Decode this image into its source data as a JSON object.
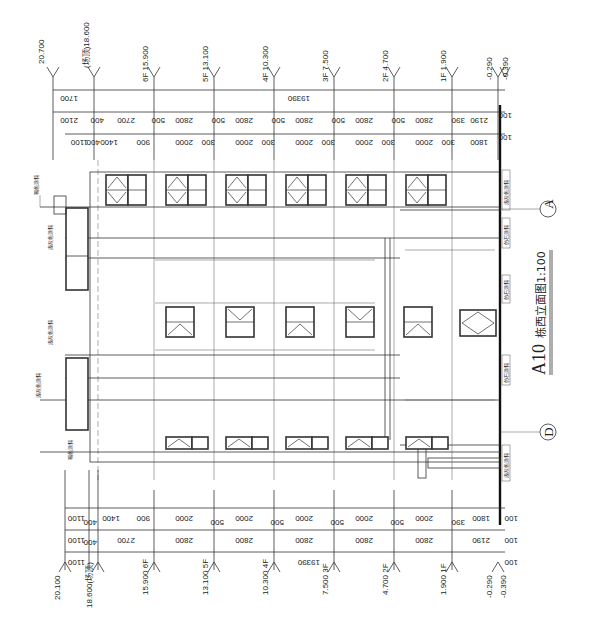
{
  "drawing": {
    "title": "A10栋西立面图1:100",
    "title_prefix": "A10",
    "title_suffix": "栋西立面图1:100",
    "orientation": "rotated 90° clockwise"
  },
  "axes": {
    "A": "A",
    "D": "D"
  },
  "levels_top": [
    {
      "label": "20.700"
    },
    {
      "label": "(场顶)18.600"
    },
    {
      "label": "6F 15.900"
    },
    {
      "label": "5F 13.100"
    },
    {
      "label": "4F 10.300"
    },
    {
      "label": "3F 7.500"
    },
    {
      "label": "2F 4.700"
    },
    {
      "label": "1F 1.900"
    },
    {
      "label": "-0.290"
    },
    {
      "label": "-0.390"
    }
  ],
  "levels_bottom": [
    {
      "label": "20.100"
    },
    {
      "label": "18.600(场顶)"
    },
    {
      "label": "15.900 6F"
    },
    {
      "label": "13.100 5F"
    },
    {
      "label": "10.300 4F"
    },
    {
      "label": "7.500 3F"
    },
    {
      "label": "4.700 2F"
    },
    {
      "label": "1.900 1F"
    },
    {
      "label": "-0.290"
    },
    {
      "label": "-0.390"
    }
  ],
  "dims_top": {
    "total_row": [
      "1700",
      "19390",
      "100"
    ],
    "floor_row": [
      "2100",
      "400",
      "2700",
      "2800",
      "500",
      "2800",
      "500",
      "2800",
      "500",
      "2800",
      "500",
      "2800",
      "500",
      "2190",
      "390",
      "100"
    ],
    "detail_row": [
      "1100",
      "400",
      "400",
      "1400",
      "900",
      "2000",
      "300",
      "2000",
      "300",
      "2000",
      "300",
      "2000",
      "300",
      "2000",
      "300",
      "1800"
    ]
  },
  "dims_bottom": {
    "total_row": [
      "1100",
      "19390",
      "100"
    ],
    "floor_row": [
      "1100",
      "400",
      "2700",
      "2800",
      "2800",
      "2800",
      "2800",
      "2800",
      "2190",
      "100"
    ],
    "detail_row": [
      "1100",
      "400",
      "1400",
      "900",
      "2000",
      "500",
      "2000",
      "500",
      "2000",
      "500",
      "2000",
      "500",
      "2000",
      "390",
      "1800",
      "100"
    ]
  },
  "material_notes": {
    "roof_paint": "褐色涂料",
    "light_paint": "浅灰色涂料",
    "stone_paint": "仿石涂料"
  }
}
